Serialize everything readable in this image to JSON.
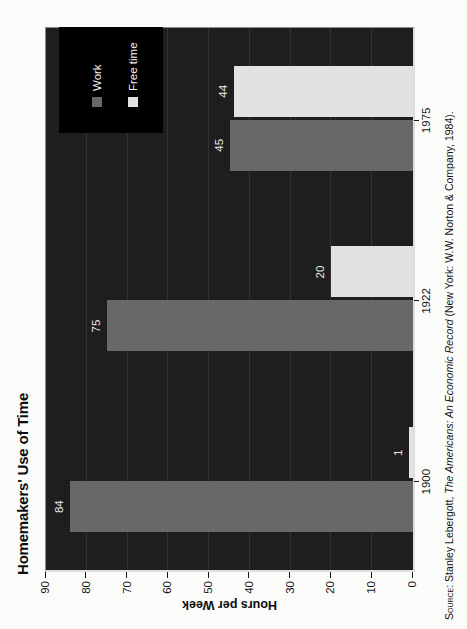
{
  "chart_data": {
    "type": "bar",
    "title": "Homemakers' Use of Time",
    "categories": [
      "1900",
      "1922",
      "1975"
    ],
    "series": [
      {
        "name": "Work",
        "values": [
          84,
          75,
          45
        ],
        "color": "#686868"
      },
      {
        "name": "Free time",
        "values": [
          1,
          20,
          44
        ],
        "color": "#e2e2e0"
      }
    ],
    "value_labels_shown": [
      [
        84,
        75,
        45
      ],
      [
        1,
        20,
        44
      ]
    ],
    "ylabel": "Hours per Week",
    "ylim": [
      0,
      90
    ],
    "ytick_step": 10,
    "yticks": [
      0,
      10,
      20,
      30,
      40,
      50,
      60,
      70,
      80,
      90
    ],
    "grid": true,
    "legend": [
      "Work",
      "Free time"
    ],
    "legend_position": "top-right-inside",
    "plot_background": "#1e1e1e",
    "legend_background": "#000000",
    "value_label_color": "#ececec",
    "source_prefix": "Source:",
    "source_text": " Stanley Lebergott, ",
    "source_italic": "The Americans: An Economic Record",
    "source_suffix": " (New York: W.W. Norton & Company, 1984)."
  }
}
